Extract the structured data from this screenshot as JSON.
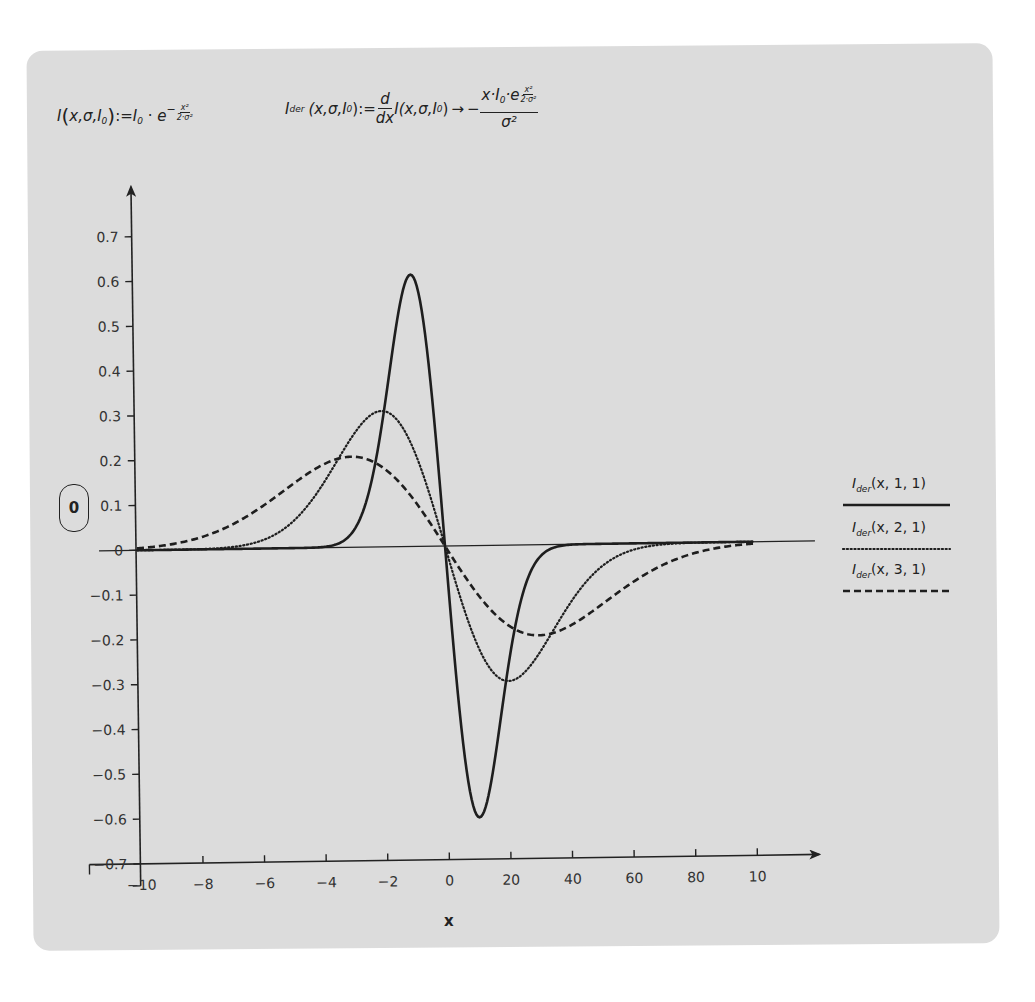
{
  "formulas": {
    "definition": {
      "lhs_fn": "I",
      "lhs_args_open": "(",
      "lhs_args": "x,σ,I",
      "lhs_args_sub": "0",
      "lhs_args_close": ")",
      "assign": ":=",
      "rhs_coef": "I",
      "rhs_coef_sub": "0",
      "dot": "·",
      "base": "e",
      "exp_sign": "−",
      "exp_num": "x²",
      "exp_den": "2·σ²"
    },
    "derivative": {
      "lhs_fn": "I",
      "lhs_fn_sub": "der",
      "lhs_args": "(x,σ,I",
      "lhs_args_sub": "0",
      "lhs_args_close": ")",
      "assign": ":=",
      "d_num": "d",
      "d_den": "dx",
      "inner": "I(x,σ,I",
      "inner_sub": "0",
      "inner_close": ")",
      "arrow": "→",
      "sign": "−",
      "res_num_a": "x·I",
      "res_num_sub": "0",
      "res_num_b": "·e",
      "res_exp_num": "x²",
      "res_exp_den": "2·σ²",
      "res_den": "σ²"
    }
  },
  "zero_box": {
    "label": "0"
  },
  "chart_data": {
    "type": "line",
    "title": "",
    "xlabel": "x",
    "ylabel": "",
    "xlim": [
      -10,
      10
    ],
    "ylim": [
      -0.7,
      0.7
    ],
    "grid": false,
    "legend_position": "right",
    "x_ticks": [
      -10,
      -8,
      -6,
      -4,
      -2,
      0,
      2,
      4,
      6,
      8,
      10
    ],
    "x_tick_labels": [
      "−10",
      "−8",
      "−6",
      "−4",
      "−2",
      "0",
      "20",
      "40",
      "60",
      "80",
      "10"
    ],
    "y_ticks": [
      0.7,
      0.6,
      0.5,
      0.4,
      0.3,
      0.2,
      0.1,
      0,
      -0.1,
      -0.2,
      -0.3,
      -0.4,
      -0.5,
      -0.6,
      -0.7
    ],
    "y_tick_labels": [
      "0.7",
      "0.6",
      "0.5",
      "0.4",
      "0.3",
      "0.2",
      "0.1",
      "0",
      "−0.1",
      "−0.2",
      "−0.3",
      "−0.4",
      "−0.5",
      "−0.6",
      "−0.7"
    ],
    "series": [
      {
        "name": "I_der(x, 1, 1)",
        "legend_fn": "I",
        "legend_sub": "der",
        "legend_args": "(x, 1, 1)",
        "sigma": 1,
        "I0": 1,
        "style": "solid",
        "x": [
          -10,
          -6,
          -4,
          -3,
          -2,
          -1.5,
          -1,
          -0.5,
          0,
          0.5,
          1,
          1.5,
          2,
          3,
          4,
          6,
          10
        ],
        "values": [
          0,
          0,
          0.001,
          0.033,
          0.271,
          0.487,
          0.607,
          0.441,
          0,
          -0.441,
          -0.607,
          -0.487,
          -0.271,
          -0.033,
          -0.001,
          0,
          0
        ]
      },
      {
        "name": "I_der(x, 2, 1)",
        "legend_fn": "I",
        "legend_sub": "der",
        "legend_args": "(x, 2, 1)",
        "sigma": 2,
        "I0": 1,
        "style": "dotted",
        "x": [
          -10,
          -8,
          -6,
          -4,
          -3,
          -2,
          -1,
          0,
          1,
          2,
          3,
          4,
          6,
          8,
          10
        ],
        "values": [
          0,
          0.001,
          0.017,
          0.135,
          0.243,
          0.303,
          0.221,
          0,
          -0.221,
          -0.303,
          -0.243,
          -0.135,
          -0.017,
          -0.001,
          0
        ]
      },
      {
        "name": "I_der(x, 3, 1)",
        "legend_fn": "I",
        "legend_sub": "der",
        "legend_args": "(x, 3, 1)",
        "sigma": 3,
        "I0": 1,
        "style": "dashed",
        "x": [
          -10,
          -8,
          -6,
          -4,
          -3,
          -2,
          -1,
          0,
          1,
          2,
          3,
          4,
          6,
          8,
          10
        ],
        "values": [
          0.004,
          0.026,
          0.09,
          0.183,
          0.202,
          0.178,
          0.105,
          0,
          -0.105,
          -0.178,
          -0.202,
          -0.183,
          -0.09,
          -0.026,
          -0.004
        ]
      }
    ]
  }
}
